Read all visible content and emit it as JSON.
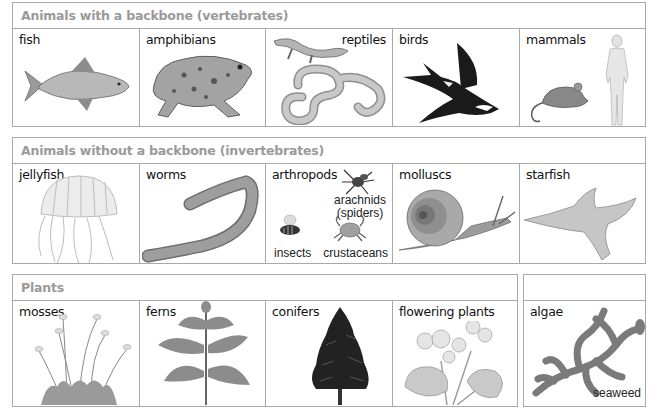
{
  "sections": [
    {
      "title": "Animals with a backbone (vertebrates)",
      "cells": [
        {
          "label": "fish",
          "icon": "fish-icon"
        },
        {
          "label": "amphibians",
          "icon": "frog-icon"
        },
        {
          "label": "reptiles",
          "icon": "lizard-snake-icon"
        },
        {
          "label": "birds",
          "icon": "swallow-icon"
        },
        {
          "label": "mammals",
          "icon": "mouse-human-icon"
        }
      ]
    },
    {
      "title": "Animals without a backbone (invertebrates)",
      "cells": [
        {
          "label": "jellyfish",
          "icon": "jellyfish-icon"
        },
        {
          "label": "worms",
          "icon": "earthworm-icon"
        },
        {
          "label": "arthropods",
          "icon": "arthropods-icon",
          "sub_labels": {
            "arachnids": "arachnids",
            "spiders": "(spiders)",
            "insects": "insects",
            "crustaceans": "crustaceans"
          }
        },
        {
          "label": "molluscs",
          "icon": "snail-icon"
        },
        {
          "label": "starfish",
          "icon": "starfish-icon"
        }
      ]
    },
    {
      "title": "Plants",
      "cells": [
        {
          "label": "mosses",
          "icon": "moss-icon"
        },
        {
          "label": "ferns",
          "icon": "fern-icon"
        },
        {
          "label": "conifers",
          "icon": "conifer-icon"
        },
        {
          "label": "flowering plants",
          "icon": "flowering-plant-icon"
        }
      ]
    },
    {
      "title": "",
      "cells": [
        {
          "label": "algae",
          "icon": "seaweed-icon",
          "sub_label": "seaweed"
        }
      ]
    }
  ],
  "colors": {
    "border": "#a9a9a9",
    "header_text": "#9a9a9a",
    "label_text": "#111111"
  }
}
